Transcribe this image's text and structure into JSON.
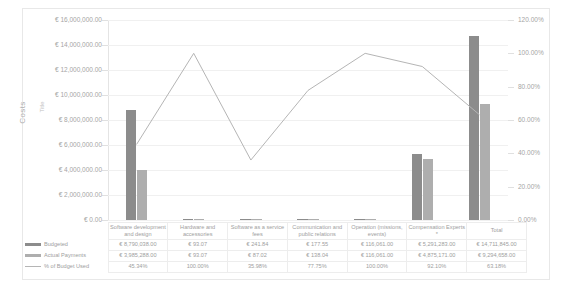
{
  "axis_titles": {
    "outer": "Costs",
    "inner": "Title"
  },
  "legend": {
    "budgeted_label": "Budgeted",
    "actual_label": "Actual Payments",
    "percent_label": "% of Budget Used"
  },
  "colors": {
    "budgeted": "#8c8c8c",
    "actual": "#aeaeae",
    "line": "#b5b5b5",
    "grid": "#f0f0f0",
    "text": "#9e9e9e"
  },
  "chart_data": {
    "type": "bar",
    "title": "",
    "xlabel": "",
    "ylabel": "Costs",
    "y2label": "",
    "ylim": [
      0,
      16000000
    ],
    "y2lim": [
      0,
      1.2
    ],
    "grid": true,
    "legend_position": "bottom-table",
    "categories": [
      "Software development and design",
      "Hardware and accessories",
      "Software as a service fees",
      "Communication and public relations",
      "Operation (missions, events)",
      "Compensation Experts *",
      "Total"
    ],
    "ytick_labels": [
      "€ 0.00",
      "€ 2,000,000.00",
      "€ 4,000,000.00",
      "€ 6,000,000.00",
      "€ 8,000,000.00",
      "€ 10,000,000.00",
      "€ 12,000,000.00",
      "€ 14,000,000.00",
      "€ 16,000,000.00"
    ],
    "ytick_values": [
      0,
      2000000,
      4000000,
      6000000,
      8000000,
      10000000,
      12000000,
      14000000,
      16000000
    ],
    "y2tick_labels": [
      "0.00%",
      "20.00%",
      "40.00%",
      "60.00%",
      "80.00%",
      "100.00%",
      "120.00%"
    ],
    "y2tick_values": [
      0,
      0.2,
      0.4,
      0.6,
      0.8,
      1.0,
      1.2
    ],
    "series": [
      {
        "name": "Budgeted",
        "type": "bar",
        "axis": "left",
        "values": [
          8790038.0,
          93.07,
          241.84,
          177.55,
          116061.0,
          5291283.0,
          14711845.0
        ],
        "labels": [
          "€ 8,790,038.00",
          "€ 93.07",
          "€ 241.84",
          "€ 177.55",
          "€ 116,061.00",
          "€ 5,291,283.00",
          "€ 14,711,845.00"
        ]
      },
      {
        "name": "Actual Payments",
        "type": "bar",
        "axis": "left",
        "values": [
          3985288.0,
          93.07,
          87.02,
          138.04,
          116061.0,
          4875171.0,
          9294658.0
        ],
        "labels": [
          "€ 3,985,288.00",
          "€ 93.07",
          "€ 87.02",
          "€ 138.04",
          "€ 116,061.00",
          "€ 4,875,171.00",
          "€ 9,294,658.00"
        ]
      },
      {
        "name": "% of Budget Used",
        "type": "line",
        "axis": "right",
        "values": [
          0.4534,
          1.0,
          0.3598,
          0.7775,
          1.0,
          0.921,
          0.6318
        ],
        "labels": [
          "45.34%",
          "100.00%",
          "35.98%",
          "77.75%",
          "100.00%",
          "92.10%",
          "63.18%"
        ]
      }
    ]
  }
}
